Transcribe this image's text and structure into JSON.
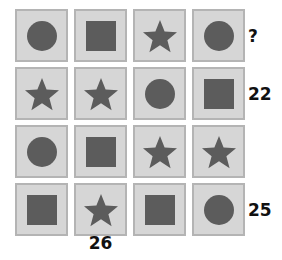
{
  "puzzle": {
    "type": "shape-sum-grid",
    "rows": 4,
    "columns": 4,
    "shape_names": [
      "circle",
      "square",
      "star"
    ],
    "colors": {
      "page_background": "#ffffff",
      "tile_background": "#d6d6d6",
      "tile_border": "#b4b4b4",
      "shape_fill": "#5c5c5c",
      "label_text": "#111111"
    },
    "grid": [
      [
        {
          "shape": "circle",
          "name": "cell-r1c1"
        },
        {
          "shape": "square",
          "name": "cell-r1c2"
        },
        {
          "shape": "star",
          "name": "cell-r1c3"
        },
        {
          "shape": "circle",
          "name": "cell-r1c4"
        }
      ],
      [
        {
          "shape": "star",
          "name": "cell-r2c1"
        },
        {
          "shape": "star",
          "name": "cell-r2c2"
        },
        {
          "shape": "circle",
          "name": "cell-r2c3"
        },
        {
          "shape": "square",
          "name": "cell-r2c4"
        }
      ],
      [
        {
          "shape": "circle",
          "name": "cell-r3c1"
        },
        {
          "shape": "square",
          "name": "cell-r3c2"
        },
        {
          "shape": "star",
          "name": "cell-r3c3"
        },
        {
          "shape": "star",
          "name": "cell-r3c4"
        }
      ],
      [
        {
          "shape": "square",
          "name": "cell-r4c1"
        },
        {
          "shape": "star",
          "name": "cell-r4c2"
        },
        {
          "shape": "square",
          "name": "cell-r4c3"
        },
        {
          "shape": "circle",
          "name": "cell-r4c4"
        }
      ]
    ],
    "row_sums": [
      "?",
      "22",
      "",
      "25"
    ],
    "column_sums": [
      "",
      "26",
      "",
      ""
    ]
  }
}
